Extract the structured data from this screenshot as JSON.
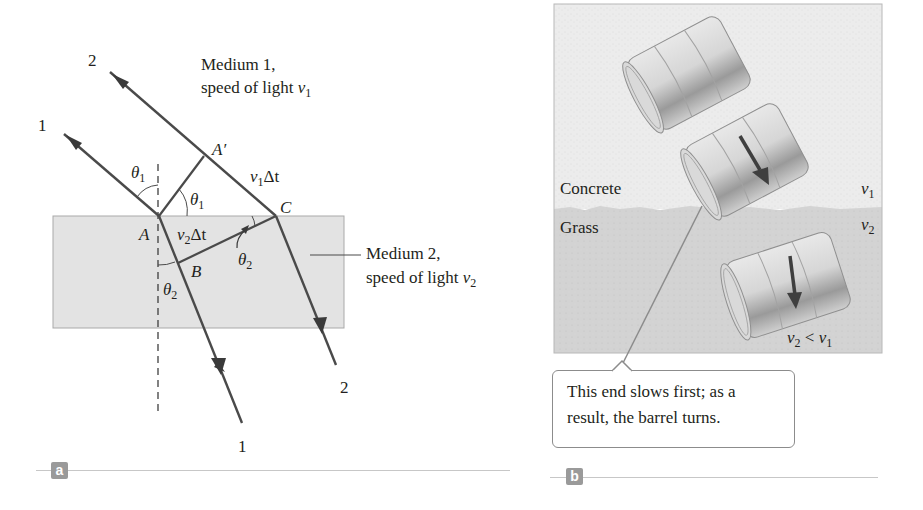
{
  "panel_a": {
    "tag": "a",
    "ray1_label_in": "1",
    "ray2_label_in": "2",
    "ray1_label_out": "1",
    "ray2_label_out": "2",
    "medium1_line1": "Medium 1,",
    "medium1_line2": "speed of light ",
    "medium1_var": "v",
    "medium1_sub": "1",
    "medium2_line1": "Medium 2,",
    "medium2_line2": "speed of light ",
    "medium2_var": "v",
    "medium2_sub": "2",
    "point_A": "A",
    "point_A_prime": "A′",
    "point_B": "B",
    "point_C": "C",
    "theta": "θ",
    "theta1_sub": "1",
    "theta2_sub": "2",
    "v1dt_var": "v",
    "v1dt_sub": "1",
    "v1dt_rest": "Δt",
    "v2dt_var": "v",
    "v2dt_sub": "2",
    "v2dt_rest": "Δt",
    "colors": {
      "ray": "#4a4a4a",
      "medium2_fill": "#e3e3e3",
      "medium2_border": "#a9a9a9"
    }
  },
  "panel_b": {
    "tag": "b",
    "top_surface": "Concrete",
    "bottom_surface": "Grass",
    "v1_var": "v",
    "v1_sub": "1",
    "v2_var": "v",
    "v2_sub": "2",
    "relation_v2": "v",
    "relation_sub2": "2",
    "relation_op": " < ",
    "relation_v1": "v",
    "relation_sub1": "1",
    "callout_line1": "This end slows first; as a",
    "callout_line2": "result, the barrel turns.",
    "colors": {
      "concrete": "#ececec",
      "grass": "#d2d2d2",
      "arrow": "#4a4a4a",
      "barrel": "#cfcfcf"
    }
  }
}
